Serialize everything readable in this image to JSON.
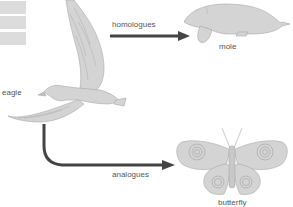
{
  "diagram": {
    "title_boxes": 3,
    "nodes": {
      "eagle": {
        "label": "eagle"
      },
      "mole": {
        "label": "mole"
      },
      "butterfly": {
        "label": "butterfly"
      }
    },
    "edges": [
      {
        "from": "eagle",
        "to": "mole",
        "label": "homologues"
      },
      {
        "from": "eagle",
        "to": "butterfly",
        "label": "analogues"
      }
    ],
    "colors": {
      "illustration_fill": "#d4d4d4",
      "illustration_stroke": "#a8a8a8",
      "arrow": "#444444",
      "label_text": "#555555",
      "box": "#dcdcdc"
    }
  }
}
